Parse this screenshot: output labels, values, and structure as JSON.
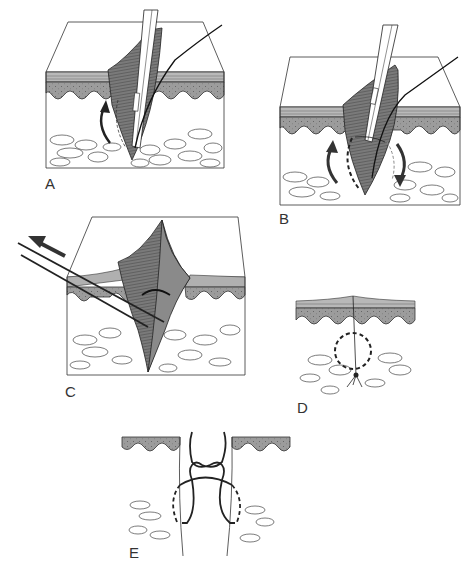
{
  "figure": {
    "type": "medical-illustration",
    "colors": {
      "background": "#ffffff",
      "line": "#222222",
      "dermis_band": "#9a9a9a",
      "epidermis_stripe": "#b8b8b8",
      "tissue_fold": "#6e6e6e",
      "instrument": "#ffffff"
    },
    "panels": [
      {
        "id": "A",
        "label": "A",
        "description": "Needle holder inserts needle at depth of wound edge; curved arrow shows upward rotation"
      },
      {
        "id": "B",
        "label": "B",
        "description": "Needle passes through both sides; dashed circular path with two curved arrows"
      },
      {
        "id": "C",
        "label": "C",
        "description": "Suture ends pulled in direction of wound axis (arrow), everting the wound edges"
      },
      {
        "id": "D",
        "label": "D",
        "description": "Closed wound with knot buried at depth; dashed circle shows suture loop"
      },
      {
        "id": "E",
        "label": "E",
        "description": "Close-up of suture loop with knot tied above, dashed path through dermis"
      }
    ]
  }
}
